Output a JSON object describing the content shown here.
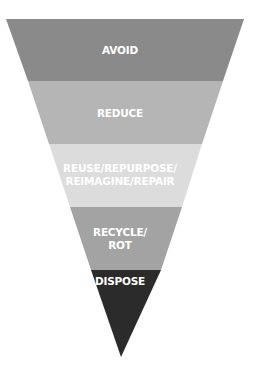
{
  "diagram": {
    "type": "inverted-pyramid",
    "title": "",
    "levels": [
      {
        "label": "AVOID",
        "color": "#8a8a8a",
        "top": 19,
        "bottom": 81
      },
      {
        "label": "REDUCE",
        "color": "#b5b5b5",
        "top": 81,
        "bottom": 144
      },
      {
        "label_line1": "REUSE/REPURPOSE/",
        "label_line2": "REIMAGINE/REPAIR",
        "color": "#dcdcdc",
        "top": 144,
        "bottom": 207
      },
      {
        "label_line1": "RECYCLE/",
        "label_line2": "ROT",
        "color": "#a3a3a3",
        "top": 207,
        "bottom": 270
      },
      {
        "label": "DISPOSE",
        "color": "#2b2b2b",
        "top": 270,
        "bottom": 357
      }
    ]
  }
}
